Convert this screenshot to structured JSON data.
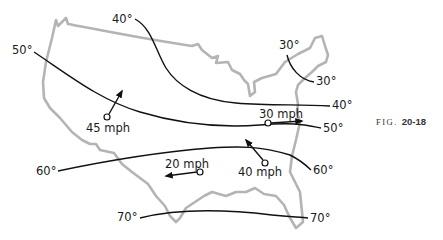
{
  "figure": {
    "caption_prefix": "FIG.",
    "caption_number": "20-18",
    "colors": {
      "outline": "#b4b4b4",
      "isotherm": "#111111",
      "text": "#1a1a1a",
      "background": "#ffffff"
    }
  },
  "isotherms": [
    {
      "id": "30",
      "start_label": "30°",
      "end_label": "30°"
    },
    {
      "id": "40",
      "start_label": "40°",
      "end_label": "40°"
    },
    {
      "id": "50",
      "start_label": "50°",
      "end_label": "50°"
    },
    {
      "id": "60",
      "start_label": "60°",
      "end_label": "60°"
    },
    {
      "id": "70",
      "start_label": "70°",
      "end_label": "70°"
    }
  ],
  "winds": [
    {
      "label": "45 mph",
      "direction": "northeast"
    },
    {
      "label": "30 mph",
      "direction": "east"
    },
    {
      "label": "40 mph",
      "direction": "northwest"
    },
    {
      "label": "20 mph",
      "direction": "west"
    }
  ]
}
